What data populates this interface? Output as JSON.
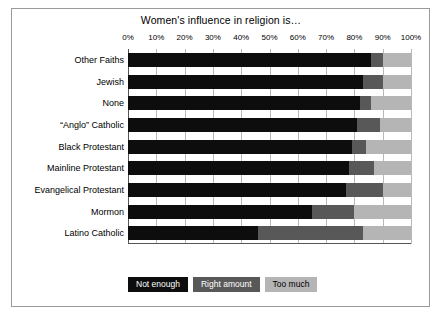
{
  "chart_data": {
    "type": "bar",
    "orientation": "horizontal",
    "stacked": true,
    "stack_mode": "percent",
    "title": "Women's influence in religion is…",
    "xlabel": "",
    "ylabel": "",
    "xlim": [
      0,
      100
    ],
    "xtick_labels": [
      "0%",
      "10%",
      "20%",
      "30%",
      "40%",
      "50%",
      "60%",
      "70%",
      "80%",
      "90%",
      "100%"
    ],
    "xtick_values": [
      0,
      10,
      20,
      30,
      40,
      50,
      60,
      70,
      80,
      90,
      100
    ],
    "grid": true,
    "legend_position": "bottom-left",
    "categories": [
      "Other Faiths",
      "Jewish",
      "None",
      "“Anglo” Catholic",
      "Black Protestant",
      "Mainline Protestant",
      "Evangelical Protestant",
      "Mormon",
      "Latino Catholic"
    ],
    "series": [
      {
        "name": "Not enough",
        "color": "#0d0d0d",
        "values": [
          86,
          83,
          82,
          81,
          79,
          78,
          77,
          65,
          46
        ]
      },
      {
        "name": "Right amount",
        "color": "#585858",
        "values": [
          4,
          7,
          4,
          8,
          5,
          9,
          13,
          15,
          37
        ]
      },
      {
        "name": "Too much",
        "color": "#b5b5b5",
        "values": [
          10,
          10,
          14,
          11,
          16,
          13,
          10,
          20,
          17
        ]
      }
    ]
  },
  "legend": {
    "items": [
      {
        "label": "Not enough",
        "color": "#0d0d0d",
        "text_color": "#ffffff"
      },
      {
        "label": "Right amount",
        "color": "#585858",
        "text_color": "#ffffff"
      },
      {
        "label": "Too much",
        "color": "#b5b5b5",
        "text_color": "#000000"
      }
    ]
  },
  "colors": {
    "background": "#ffffff",
    "frame_border": "#9a9a9a",
    "gridline": "#b9b9b9",
    "axis": "#555555",
    "text": "#000000"
  }
}
